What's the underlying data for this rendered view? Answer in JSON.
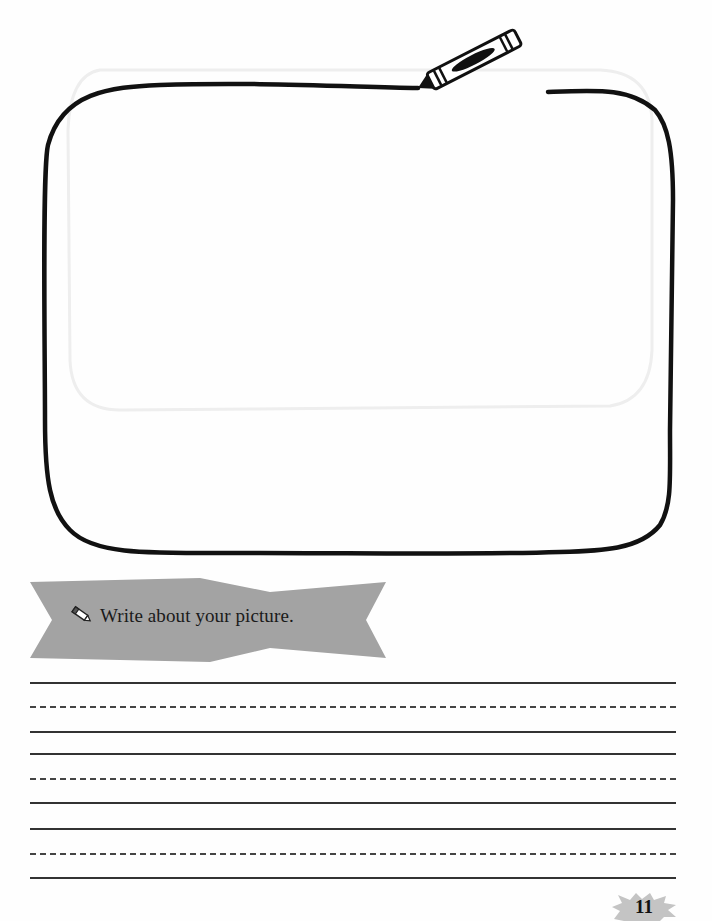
{
  "prompt": {
    "icon": "pencil-icon",
    "text": "Write about your picture."
  },
  "drawing_area": {
    "icon": "crayon-icon",
    "stroke_color": "#111111"
  },
  "writing_lines": [
    {
      "style": "solid",
      "y": 683
    },
    {
      "style": "dashed",
      "y": 707
    },
    {
      "style": "solid",
      "y": 732
    },
    {
      "style": "solid",
      "y": 754
    },
    {
      "style": "dashed",
      "y": 779
    },
    {
      "style": "solid",
      "y": 803
    },
    {
      "style": "solid",
      "y": 829
    },
    {
      "style": "dashed",
      "y": 854
    },
    {
      "style": "solid",
      "y": 878
    }
  ],
  "page_number": "11",
  "colors": {
    "banner_fill": "#a3a3a3",
    "page_badge_fill": "#c4c4c4",
    "line_color": "#333333"
  }
}
